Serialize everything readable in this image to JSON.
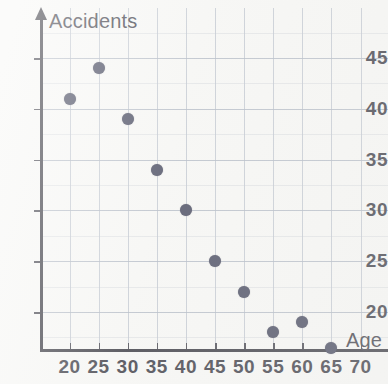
{
  "chart_data": {
    "type": "scatter",
    "title": "",
    "xlabel": "Age",
    "ylabel": "Accidents",
    "x": [
      20,
      25,
      30,
      35,
      40,
      45,
      50,
      55,
      60,
      65
    ],
    "y": [
      41,
      44,
      39,
      34,
      30,
      25,
      22,
      18,
      19,
      16.5
    ],
    "points": [
      {
        "x": 20,
        "y": 41
      },
      {
        "x": 25,
        "y": 44
      },
      {
        "x": 30,
        "y": 39
      },
      {
        "x": 35,
        "y": 34
      },
      {
        "x": 40,
        "y": 30
      },
      {
        "x": 45,
        "y": 25
      },
      {
        "x": 50,
        "y": 22
      },
      {
        "x": 55,
        "y": 18
      },
      {
        "x": 60,
        "y": 19
      },
      {
        "x": 65,
        "y": 16.5
      }
    ],
    "x_ticks": [
      20,
      25,
      30,
      35,
      40,
      45,
      50,
      55,
      60,
      70
    ],
    "x_tick_labels": [
      "20",
      "25",
      "30",
      "35",
      "40",
      "45",
      "50",
      "55",
      "60",
      "65",
      "70"
    ],
    "y_tick_labels": [
      "45",
      "40",
      "35",
      "30",
      "25",
      "20"
    ],
    "y_ticks": [
      45,
      40,
      35,
      30,
      25,
      20
    ],
    "xlim": [
      15,
      72
    ],
    "ylim": [
      14.5,
      47
    ],
    "grid": true,
    "legend": "none",
    "marker_color": "#3b3e55",
    "grid_color": "#b9bfca",
    "axis_color": "#2c2c35",
    "background_color": "#f7f7f5"
  },
  "labels": {
    "y_axis_title": "Accidents",
    "x_axis_title": "Age"
  }
}
